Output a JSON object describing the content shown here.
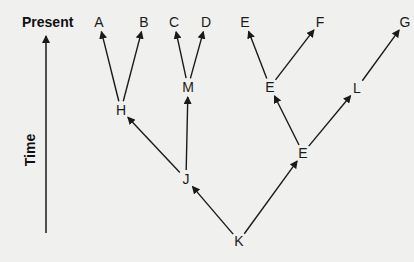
{
  "diagram": {
    "axis": {
      "top_label": "Present",
      "side_label": "Time"
    },
    "nodes": [
      {
        "id": "A",
        "label": "A",
        "x": 99,
        "y": 22
      },
      {
        "id": "B",
        "label": "B",
        "x": 144,
        "y": 22
      },
      {
        "id": "C",
        "label": "C",
        "x": 174,
        "y": 22
      },
      {
        "id": "D",
        "label": "D",
        "x": 206,
        "y": 22
      },
      {
        "id": "E1",
        "label": "E",
        "x": 245,
        "y": 22
      },
      {
        "id": "F",
        "label": "F",
        "x": 320,
        "y": 22
      },
      {
        "id": "G",
        "label": "G",
        "x": 405,
        "y": 22
      },
      {
        "id": "H",
        "label": "H",
        "x": 121,
        "y": 110
      },
      {
        "id": "M",
        "label": "M",
        "x": 188,
        "y": 87
      },
      {
        "id": "E2",
        "label": "E",
        "x": 270,
        "y": 87
      },
      {
        "id": "L",
        "label": "L",
        "x": 357,
        "y": 88
      },
      {
        "id": "J",
        "label": "J",
        "x": 186,
        "y": 179
      },
      {
        "id": "E3",
        "label": "E",
        "x": 303,
        "y": 153
      },
      {
        "id": "K",
        "label": "K",
        "x": 239,
        "y": 241
      }
    ],
    "edges": [
      [
        "H",
        "A"
      ],
      [
        "H",
        "B"
      ],
      [
        "M",
        "C"
      ],
      [
        "M",
        "D"
      ],
      [
        "E2",
        "E1"
      ],
      [
        "E2",
        "F"
      ],
      [
        "L",
        "G"
      ],
      [
        "J",
        "H"
      ],
      [
        "J",
        "M"
      ],
      [
        "E3",
        "E2"
      ],
      [
        "E3",
        "L"
      ],
      [
        "K",
        "J"
      ],
      [
        "K",
        "E3"
      ]
    ]
  }
}
